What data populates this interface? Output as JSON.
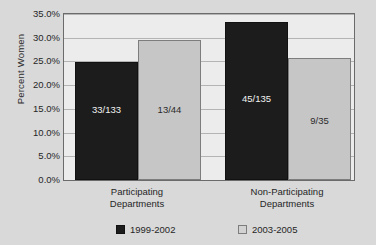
{
  "chart_data": {
    "type": "bar",
    "title": "",
    "xlabel": "",
    "ylabel": "Percent Women",
    "ylim": [
      0,
      35
    ],
    "grid": true,
    "legend_position": "bottom",
    "categories": [
      "Participating Departments",
      "Non-Participating Departments"
    ],
    "category_lines": [
      [
        "Participating",
        "Departments"
      ],
      [
        "Non-Participating",
        "Departments"
      ]
    ],
    "ytick_labels": [
      "35.0%",
      "30.0%",
      "25.0%",
      "20.0%",
      "15.0%",
      "10.0%",
      "5.0%",
      "0.0%"
    ],
    "ytick_values": [
      35,
      30,
      25,
      20,
      15,
      10,
      5,
      0
    ],
    "series": [
      {
        "name": "1999-2002",
        "color": "#1c1c1c",
        "values": [
          24.8,
          33.3
        ],
        "data_labels": [
          "33/133",
          "45/135"
        ]
      },
      {
        "name": "2003-2005",
        "color": "#c6c6c6",
        "values": [
          29.5,
          25.7
        ],
        "data_labels": [
          "13/44",
          "9/35"
        ]
      }
    ]
  },
  "axis": {
    "y_title": "Percent Women"
  },
  "legend": {
    "items": [
      {
        "label": "1999-2002",
        "swatch": "dark"
      },
      {
        "label": "2003-2005",
        "swatch": "light"
      }
    ]
  },
  "colors": {
    "series_1999_2002": "#1c1c1c",
    "series_2003_2005": "#c6c6c6",
    "plot_background": "#ececec",
    "page_background": "#d9d9d9",
    "gridline": "#b4b4b4",
    "axis_border": "#6b6b6b"
  }
}
